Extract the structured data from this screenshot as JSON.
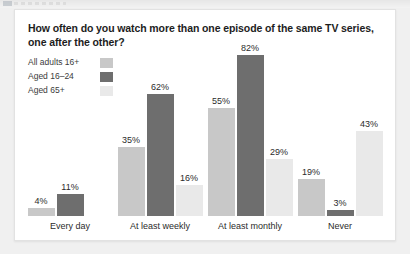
{
  "card": {
    "title": "How often do you watch more than one episode of the same TV series, one after the other?"
  },
  "legend": {
    "items": [
      {
        "label": "All adults 16+",
        "color": "#c8c8c8"
      },
      {
        "label": "Aged 16–24",
        "color": "#6e6e6e"
      },
      {
        "label": "Aged 65+",
        "color": "#e9e9e9"
      }
    ]
  },
  "chart_data": {
    "type": "bar",
    "title": "How often do you watch more than one episode of the same TV series, one after the other?",
    "xlabel": "",
    "ylabel": "",
    "ylim": [
      0,
      90
    ],
    "grid": false,
    "legend_position": "top-left",
    "value_suffix": "%",
    "categories": [
      "Every day",
      "At least weekly",
      "At least monthly",
      "Never"
    ],
    "series": [
      {
        "name": "All adults 16+",
        "color": "#c8c8c8",
        "values": [
          4,
          35,
          55,
          19
        ],
        "labels": [
          "4%",
          "35%",
          "55%",
          "19%"
        ]
      },
      {
        "name": "Aged 16–24",
        "color": "#6e6e6e",
        "values": [
          11,
          62,
          82,
          3
        ],
        "labels": [
          "11%",
          "62%",
          "82%",
          "3%"
        ]
      },
      {
        "name": "Aged 65+",
        "color": "#e9e9e9",
        "values": [
          0,
          16,
          29,
          43
        ],
        "labels": [
          "0%",
          "16%",
          "29%",
          "43%"
        ]
      }
    ]
  }
}
